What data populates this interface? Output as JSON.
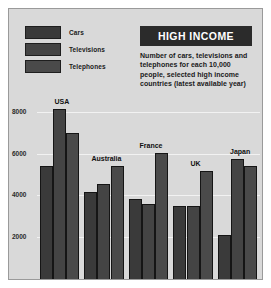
{
  "header": {
    "title": "HIGH INCOME",
    "description": "Number of cars, televisions and telephones for each 10,000 people, selected high income countries (latest available year)"
  },
  "legend": {
    "items": [
      {
        "label": "Cars",
        "color": "#3a3a3a"
      },
      {
        "label": "Televisions",
        "color": "#444444"
      },
      {
        "label": "Telephones",
        "color": "#4a4a4a"
      }
    ]
  },
  "colors": {
    "page_background": "#ffffff",
    "plot_background": "#d9d9d9",
    "frame": "#9a9a9a",
    "gridline": "#f2f2f2",
    "title_box": "#2b2b2b",
    "title_text": "#ffffff",
    "text": "#1a1a1a"
  },
  "chart_data": {
    "type": "bar",
    "title": "HIGH INCOME",
    "subtitle": "Number of cars, televisions and telephones for each 10,000 people, selected high income countries (latest available year)",
    "xlabel": "",
    "ylabel": "",
    "ylim": [
      0,
      8800
    ],
    "yticks": [
      2000,
      4000,
      6000,
      8000
    ],
    "ytick_labels": [
      "2000",
      "4000",
      "6000",
      "8000"
    ],
    "grid": true,
    "legend_position": "top-left",
    "categories": [
      "USA",
      "Australia",
      "France",
      "UK",
      "Japan"
    ],
    "series": [
      {
        "name": "Cars",
        "color": "#3a3a3a",
        "values": [
          5400,
          4150,
          3850,
          3500,
          2100
        ]
      },
      {
        "name": "Televisions",
        "color": "#444444",
        "values": [
          8150,
          4550,
          3600,
          3500,
          5750
        ]
      },
      {
        "name": "Telephones",
        "color": "#4a4a4a",
        "values": [
          7000,
          5400,
          6050,
          5150,
          5400
        ]
      }
    ]
  }
}
